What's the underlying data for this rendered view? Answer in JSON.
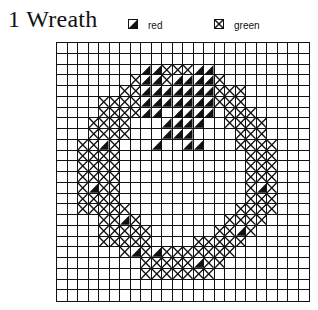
{
  "chart": {
    "number": "1",
    "title": "1  Wreath",
    "columns": 24,
    "rows": 24
  },
  "legend": [
    {
      "symbol": "half-filled-diagonal",
      "label": "red",
      "code": "R"
    },
    {
      "symbol": "x-in-box",
      "label": "green",
      "code": "X"
    }
  ],
  "pattern": [
    "........................",
    "........................",
    "........RRXXXRR.........",
    ".......XRRXRRRRX........",
    "......XXRRRRRRRXXX......",
    "....XXXXRRRRRRRXXX......",
    "....XXXXRR.RRRR.XXX.....",
    "...XXXX...RRRR..XXXX....",
    "...XXXX...RRR....XXX....",
    "..XXRX...R..RR...XXXX...",
    "..XXXX............XXX...",
    "..XXXX............XXX...",
    "..XXXX............XXX...",
    "..XRXX............XRX...",
    "..XXXX............XXX...",
    "..XXXXX..........XXXX...",
    "....XXRX........XXXX....",
    "....XXXXX......XXRX.....",
    "....XXXXX....XXXXX......",
    "......XRXRXXXXXXX.......",
    "........XXXXXRXX........",
    "........XXXXXXX.........",
    "........................",
    "........................"
  ]
}
